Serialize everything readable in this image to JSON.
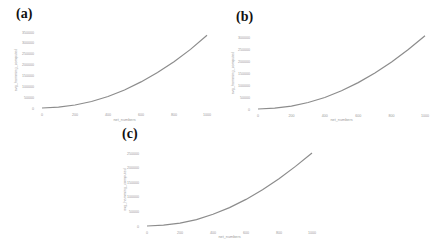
{
  "chart_data": [
    {
      "panel": "(a)",
      "type": "line",
      "title": "",
      "xlabel": "net_numbers",
      "ylabel": "avg_hamming_computed",
      "xticks": [
        "0",
        "200",
        "400",
        "600",
        "800",
        "1000"
      ],
      "yticks": [
        "0",
        "50000",
        "100000",
        "150000",
        "200000",
        "250000",
        "300000",
        "350000"
      ],
      "xlim": [
        0,
        1000
      ],
      "ylim": [
        0,
        350000
      ],
      "grid": false,
      "series": [
        {
          "name": "curve",
          "x": [
            0,
            100,
            200,
            300,
            400,
            500,
            600,
            700,
            800,
            900,
            1000
          ],
          "values": [
            0,
            4000,
            14000,
            30000,
            53000,
            83000,
            120000,
            163000,
            213000,
            270000,
            335000
          ]
        }
      ]
    },
    {
      "panel": "(b)",
      "type": "line",
      "title": "",
      "xlabel": "net_numbers",
      "ylabel": "avg_hamming_computed",
      "xticks": [
        "0",
        "200",
        "400",
        "600",
        "800",
        "1000"
      ],
      "yticks": [
        "0",
        "50000",
        "100000",
        "150000",
        "200000",
        "250000",
        "300000"
      ],
      "xlim": [
        0,
        1000
      ],
      "ylim": [
        0,
        300000
      ],
      "grid": false,
      "series": [
        {
          "name": "curve",
          "x": [
            0,
            100,
            200,
            300,
            400,
            500,
            600,
            700,
            800,
            900,
            1000
          ],
          "values": [
            0,
            3500,
            12000,
            27000,
            48000,
            76000,
            110000,
            150000,
            196000,
            248000,
            305000
          ]
        }
      ]
    },
    {
      "panel": "(c)",
      "type": "line",
      "title": "",
      "xlabel": "net_numbers",
      "ylabel": "avg_hamming_computed",
      "xticks": [
        "0",
        "200",
        "400",
        "600",
        "800",
        "1000"
      ],
      "yticks": [
        "0",
        "50000",
        "100000",
        "150000",
        "200000",
        "250000"
      ],
      "xlim": [
        0,
        1000
      ],
      "ylim": [
        0,
        250000
      ],
      "grid": false,
      "series": [
        {
          "name": "curve",
          "x": [
            0,
            100,
            200,
            300,
            400,
            500,
            600,
            700,
            800,
            900,
            1000
          ],
          "values": [
            0,
            3000,
            10000,
            22000,
            40000,
            63000,
            91000,
            124000,
            162000,
            204000,
            250000
          ]
        }
      ]
    }
  ],
  "panels": [
    {
      "label": "(a)"
    },
    {
      "label": "(b)"
    },
    {
      "label": "(c)"
    }
  ],
  "style": {
    "line_color": "#8c8c8c",
    "text_color": "#9a9a9a",
    "label_color": "#111111"
  }
}
